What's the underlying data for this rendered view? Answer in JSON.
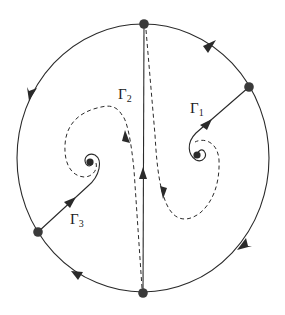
{
  "diagram": {
    "type": "phase-portrait",
    "labels": {
      "gamma1": {
        "symbol": "Γ",
        "sub": "1"
      },
      "gamma2": {
        "symbol": "Γ",
        "sub": "2"
      },
      "gamma3": {
        "symbol": "Γ",
        "sub": "3"
      }
    },
    "colors": {
      "stroke": "#2a2a2a",
      "node": "#3a3a3a",
      "background": "#ffffff"
    },
    "nodes": [
      {
        "id": "top",
        "x": 144,
        "y": 24
      },
      {
        "id": "bottom",
        "x": 143,
        "y": 293
      },
      {
        "id": "right",
        "x": 249,
        "y": 87
      },
      {
        "id": "left",
        "x": 38,
        "y": 232
      },
      {
        "id": "focus-left",
        "x": 90,
        "y": 162
      },
      {
        "id": "focus-right",
        "x": 197,
        "y": 155
      }
    ]
  }
}
